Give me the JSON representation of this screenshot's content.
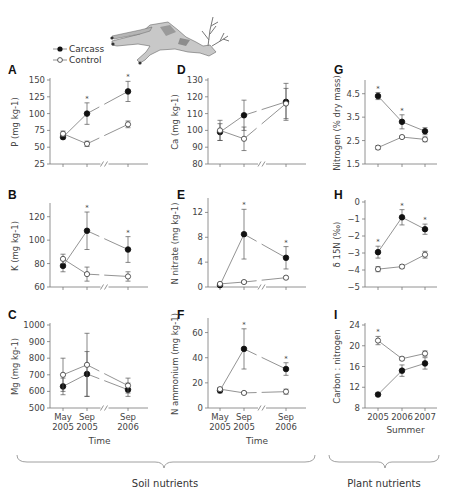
{
  "legend": {
    "items": [
      {
        "label": "Carcass",
        "marker": "filled-circle"
      },
      {
        "label": "Control",
        "marker": "open-circle"
      }
    ]
  },
  "groups": [
    {
      "label": "Soil nutrients",
      "panels": [
        "A",
        "B",
        "C",
        "D",
        "E",
        "F"
      ]
    },
    {
      "label": "Plant nutrients",
      "panels": [
        "G",
        "H",
        "I"
      ]
    }
  ],
  "chart_data": [
    {
      "id": "A",
      "type": "line",
      "title": "A",
      "xlabel": "Time",
      "ylabel": "P (mg kg-1)",
      "categories": [
        "May 2005",
        "Sep 2005",
        "Sep 2006"
      ],
      "ylim": [
        25,
        150
      ],
      "yticks": [
        25,
        50,
        75,
        100,
        125,
        150
      ],
      "axis_break": true,
      "series": [
        {
          "name": "Carcass",
          "values": [
            65,
            100,
            133
          ],
          "err": [
            3,
            16,
            15
          ],
          "significant": [
            false,
            true,
            true
          ]
        },
        {
          "name": "Control",
          "values": [
            70,
            55,
            84
          ],
          "err": [
            4,
            4,
            5
          ]
        }
      ]
    },
    {
      "id": "B",
      "type": "line",
      "title": "B",
      "xlabel": "Time",
      "ylabel": "K (mg kg-1)",
      "categories": [
        "May 2005",
        "Sep 2005",
        "Sep 2006"
      ],
      "ylim": [
        60,
        130
      ],
      "yticks": [
        60,
        80,
        100,
        120
      ],
      "axis_break": true,
      "series": [
        {
          "name": "Carcass",
          "values": [
            78,
            108,
            92
          ],
          "err": [
            5,
            16,
            11
          ],
          "significant": [
            false,
            true,
            true
          ]
        },
        {
          "name": "Control",
          "values": [
            84,
            71,
            69
          ],
          "err": [
            4,
            6,
            4
          ]
        }
      ]
    },
    {
      "id": "C",
      "type": "line",
      "title": "C",
      "xlabel": "Time",
      "ylabel": "Mg (mg kg-1)",
      "categories": [
        "May 2005",
        "Sep 2005",
        "Sep 2006"
      ],
      "ylim": [
        500,
        1000
      ],
      "yticks": [
        500,
        600,
        700,
        800,
        900,
        1000
      ],
      "axis_break": true,
      "series": [
        {
          "name": "Carcass",
          "values": [
            630,
            705,
            610
          ],
          "err": [
            50,
            135,
            40
          ]
        },
        {
          "name": "Control",
          "values": [
            700,
            760,
            635
          ],
          "err": [
            100,
            190,
            45
          ]
        }
      ]
    },
    {
      "id": "D",
      "type": "line",
      "title": "D",
      "xlabel": "Time",
      "ylabel": "Ca (mg kg-1)",
      "categories": [
        "May 2005",
        "Sep 2005",
        "Sep 2006"
      ],
      "ylim": [
        80,
        130
      ],
      "yticks": [
        80,
        90,
        100,
        110,
        120,
        130
      ],
      "axis_break": true,
      "series": [
        {
          "name": "Carcass",
          "values": [
            99,
            109,
            117
          ],
          "err": [
            5,
            9,
            11
          ]
        },
        {
          "name": "Control",
          "values": [
            100,
            95,
            116
          ],
          "err": [
            6,
            7,
            9
          ]
        }
      ]
    },
    {
      "id": "E",
      "type": "line",
      "title": "E",
      "xlabel": "Time",
      "ylabel": "N nitrate (mg kg-1)",
      "categories": [
        "May 2005",
        "Sep 2005",
        "Sep 2006"
      ],
      "ylim": [
        0,
        14
      ],
      "yticks": [
        0,
        4,
        8,
        12
      ],
      "axis_break": true,
      "series": [
        {
          "name": "Carcass",
          "values": [
            0.3,
            8.5,
            4.7
          ],
          "err": [
            0.1,
            4.0,
            1.8
          ],
          "significant": [
            false,
            true,
            true
          ]
        },
        {
          "name": "Control",
          "values": [
            0.5,
            0.8,
            1.5
          ],
          "err": [
            0.1,
            0.2,
            0.2
          ]
        }
      ]
    },
    {
      "id": "F",
      "type": "line",
      "title": "F",
      "xlabel": "Time",
      "ylabel": "N ammonium (mg kg-1)",
      "categories": [
        "May 2005",
        "Sep 2005",
        "Sep 2006"
      ],
      "ylim": [
        0,
        70
      ],
      "yticks": [
        0,
        20,
        40,
        60
      ],
      "axis_break": true,
      "series": [
        {
          "name": "Carcass",
          "values": [
            14,
            47,
            31
          ],
          "err": [
            2,
            16,
            5
          ],
          "significant": [
            false,
            true,
            true
          ]
        },
        {
          "name": "Control",
          "values": [
            15,
            12,
            13
          ],
          "err": [
            1,
            1,
            2
          ]
        }
      ]
    },
    {
      "id": "G",
      "type": "line",
      "title": "G",
      "xlabel": "Summer",
      "ylabel": "Nitrogen (% dry mass)",
      "categories": [
        "2005",
        "2006",
        "2007"
      ],
      "ylim": [
        1.5,
        5.0
      ],
      "yticks": [
        1.5,
        2.5,
        3.5,
        4.5
      ],
      "axis_break": false,
      "series": [
        {
          "name": "Carcass",
          "values": [
            4.4,
            3.3,
            2.9
          ],
          "err": [
            0.15,
            0.3,
            0.15
          ],
          "significant": [
            true,
            true,
            false
          ]
        },
        {
          "name": "Control",
          "values": [
            2.2,
            2.65,
            2.55
          ],
          "err": [
            0.08,
            0.05,
            0.1
          ]
        }
      ]
    },
    {
      "id": "H",
      "type": "line",
      "title": "H",
      "xlabel": "Summer",
      "ylabel": "δ 15N (‰)",
      "categories": [
        "2005",
        "2006",
        "2007"
      ],
      "ylim": [
        -5,
        0
      ],
      "yticks": [
        -5,
        -4,
        -3,
        -2,
        -1,
        0
      ],
      "axis_break": false,
      "series": [
        {
          "name": "Carcass",
          "values": [
            -2.95,
            -0.9,
            -1.6
          ],
          "err": [
            0.35,
            0.45,
            0.3
          ],
          "significant": [
            true,
            true,
            true
          ]
        },
        {
          "name": "Control",
          "values": [
            -3.95,
            -3.8,
            -3.1
          ],
          "err": [
            0.15,
            0.1,
            0.2
          ]
        }
      ]
    },
    {
      "id": "I",
      "type": "line",
      "title": "I",
      "xlabel": "Summer",
      "ylabel": "Carbon : nitrogen",
      "categories": [
        "2005",
        "2006",
        "2007"
      ],
      "ylim": [
        8,
        24
      ],
      "yticks": [
        8,
        12,
        16,
        20,
        24
      ],
      "axis_break": false,
      "series": [
        {
          "name": "Carcass",
          "values": [
            10.6,
            15.2,
            16.6
          ],
          "err": [
            0.3,
            1.1,
            1.1
          ]
        },
        {
          "name": "Control",
          "values": [
            21.0,
            17.5,
            18.5
          ],
          "err": [
            0.8,
            0.3,
            0.5
          ],
          "significant": [
            true,
            false,
            false
          ]
        }
      ]
    }
  ]
}
